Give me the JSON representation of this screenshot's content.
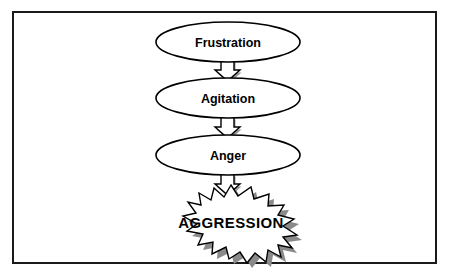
{
  "diagram": {
    "frame": {
      "border_color": "#1a1a1a",
      "background_color": "#ffffff"
    },
    "nodes": [
      {
        "id": "frustration",
        "label": "Frustration",
        "shape": "ellipse",
        "cx": 228,
        "cy": 42,
        "rx": 72,
        "ry": 20,
        "fill": "#ffffff",
        "stroke": "#000000"
      },
      {
        "id": "agitation",
        "label": "Agitation",
        "shape": "ellipse",
        "cx": 228,
        "cy": 98,
        "rx": 72,
        "ry": 20,
        "fill": "#ffffff",
        "stroke": "#000000"
      },
      {
        "id": "anger",
        "label": "Anger",
        "shape": "ellipse",
        "cx": 228,
        "cy": 155,
        "rx": 72,
        "ry": 20,
        "fill": "#ffffff",
        "stroke": "#000000"
      },
      {
        "id": "aggression",
        "label": "AGGRESSION",
        "shape": "starburst",
        "cx": 231,
        "cy": 219,
        "fill": "#ffffff",
        "stroke": "#000000",
        "shadow_color": "#8a8a8a"
      }
    ],
    "connectors": [
      {
        "id": "frustration-to-agitation",
        "from": "frustration",
        "to": "agitation",
        "style": "block-arrow-down",
        "fill": "#ffffff",
        "stroke": "#000000"
      },
      {
        "id": "agitation-to-anger",
        "from": "agitation",
        "to": "anger",
        "style": "block-arrow-down",
        "fill": "#ffffff",
        "stroke": "#000000"
      },
      {
        "id": "anger-to-aggression",
        "from": "anger",
        "to": "aggression",
        "style": "block-arrow-down",
        "fill": "#ffffff",
        "stroke": "#000000"
      }
    ]
  }
}
